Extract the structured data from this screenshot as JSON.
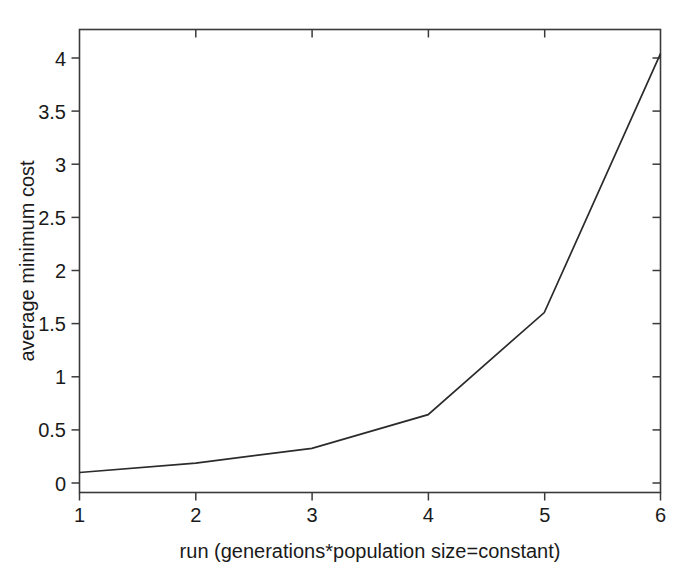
{
  "chart_data": {
    "type": "line",
    "title": "",
    "xlabel": "run (generations*population size=constant)",
    "ylabel": "average minimum cost",
    "x": [
      1,
      2,
      3,
      4,
      5,
      6
    ],
    "categories": [
      "1",
      "2",
      "3",
      "4",
      "5",
      "6"
    ],
    "values": [
      0.1,
      0.19,
      0.33,
      0.65,
      1.62,
      4.08
    ],
    "series": [
      {
        "name": "average minimum cost",
        "values": [
          0.1,
          0.19,
          0.33,
          0.65,
          1.62,
          4.08
        ]
      }
    ],
    "xlim": [
      1,
      6
    ],
    "ylim": [
      -0.09,
      4.31
    ],
    "xticks": [
      1,
      2,
      3,
      4,
      5,
      6
    ],
    "xtick_labels": [
      "1",
      "2",
      "3",
      "4",
      "5",
      "6"
    ],
    "yticks": [
      0,
      0.5,
      1,
      1.5,
      2,
      2.5,
      3,
      3.5,
      4
    ],
    "ytick_labels": [
      "0",
      "0.5",
      "1",
      "1.5",
      "2",
      "2.5",
      "3",
      "3.5",
      "4"
    ],
    "grid": false,
    "legend": null,
    "legend_position": "none",
    "line_color": "#2b2b2b",
    "axis_color": "#3a3a3a",
    "background_color": "#ffffff",
    "markers": false,
    "annotations": []
  }
}
